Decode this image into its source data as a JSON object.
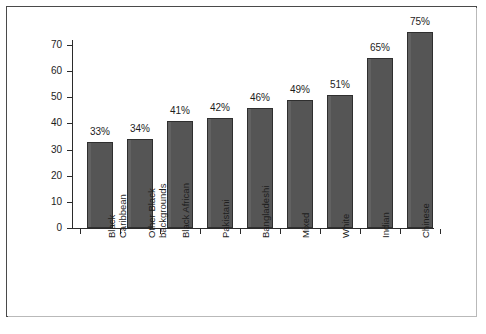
{
  "chart_data": {
    "type": "bar",
    "title": "",
    "subtitle": "",
    "xlabel": "",
    "ylabel": "",
    "ylim": [
      0,
      75
    ],
    "yticks": [
      0,
      10,
      20,
      30,
      40,
      50,
      60,
      70
    ],
    "grid": false,
    "legend": false,
    "bar_color": "#555555",
    "bar_edge_color": "#2f2f2f",
    "background_color": "#ffffff",
    "frame_color": "#4a4a4a",
    "categories": [
      "Black Caribbean",
      "Other Black backgrounds",
      "Black African",
      "Pakistani",
      "Bangladeshi",
      "Mixed",
      "White",
      "Indian",
      "Chinese"
    ],
    "category_label_lines": [
      [
        "Black",
        "Caribbean"
      ],
      [
        "Other Black",
        "backgrounds"
      ],
      [
        "Black African"
      ],
      [
        "Pakistani"
      ],
      [
        "Bangladeshi"
      ],
      [
        "Mixed"
      ],
      [
        "White"
      ],
      [
        "Indian"
      ],
      [
        "Chinese"
      ]
    ],
    "values": [
      33,
      34,
      41,
      42,
      46,
      49,
      51,
      65,
      75
    ],
    "data_labels": [
      "33%",
      "34%",
      "41%",
      "42%",
      "46%",
      "49%",
      "51%",
      "65%",
      "75%"
    ]
  }
}
